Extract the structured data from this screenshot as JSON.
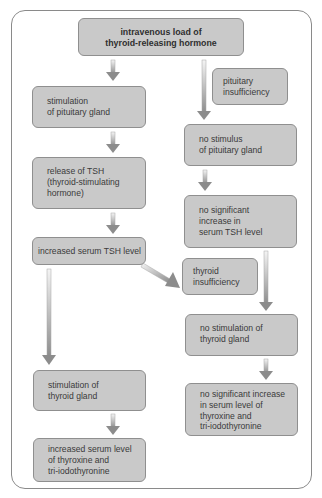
{
  "diagram": {
    "type": "flowchart",
    "colors": {
      "box_fill": "#c9c9c9",
      "box_border": "#8f8f8f",
      "frame_border": "#8a8a8a",
      "arrow_light": "#f2f2f2",
      "arrow_dark": "#8c8c8c"
    },
    "top": {
      "label": "intravenous load of\nthyroid-releasing hormone"
    },
    "left_column": [
      {
        "id": "stim-pituitary",
        "label": "stimulation\nof pituitary gland"
      },
      {
        "id": "release-tsh",
        "label": "release of TSH\n(thyroid-stimulating\nhormone)"
      },
      {
        "id": "increased-tsh",
        "label": "increased serum TSH level"
      },
      {
        "id": "stim-thyroid",
        "label": "stimulation of\nthyroid gland"
      },
      {
        "id": "increased-t4t3",
        "label": "increased serum level\nof thyroxine and\ntri-iodothyronine"
      }
    ],
    "right_column": [
      {
        "id": "pituitary-insufficiency",
        "label": "pituitary\ninsufficiency"
      },
      {
        "id": "no-stim-pituitary",
        "label": "no stimulus\nof pituitary gland"
      },
      {
        "id": "no-increase-tsh",
        "label": "no significant\nincrease in\nserum TSH level"
      },
      {
        "id": "thyroid-insufficiency",
        "label": "thyroid\ninsufficiency"
      },
      {
        "id": "no-stim-thyroid",
        "label": "no stimulation of\nthyroid gland"
      },
      {
        "id": "no-increase-t4t3",
        "label": "no significant increase\nin serum level of\nthyroxine and\ntri-iodothyronine"
      }
    ],
    "edges": [
      {
        "from": "top",
        "to": "stim-pituitary"
      },
      {
        "from": "top",
        "to": "no-stim-pituitary"
      },
      {
        "from": "stim-pituitary",
        "to": "release-tsh"
      },
      {
        "from": "release-tsh",
        "to": "increased-tsh"
      },
      {
        "from": "increased-tsh",
        "to": "stim-thyroid"
      },
      {
        "from": "increased-tsh",
        "to": "thyroid-insufficiency"
      },
      {
        "from": "stim-thyroid",
        "to": "increased-t4t3"
      },
      {
        "from": "no-stim-pituitary",
        "to": "no-increase-tsh"
      },
      {
        "from": "no-increase-tsh",
        "to": "no-stim-thyroid"
      },
      {
        "from": "no-stim-thyroid",
        "to": "no-increase-t4t3"
      }
    ]
  }
}
